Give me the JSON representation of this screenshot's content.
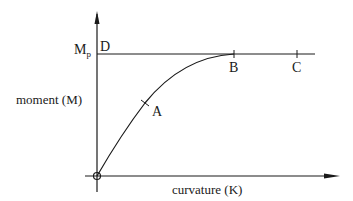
{
  "diagram": {
    "y_axis_label": "moment (M)",
    "x_axis_label": "curvature (K)",
    "plastic_moment_label": {
      "main": "M",
      "sub": "p"
    },
    "points": {
      "D": "D",
      "A": "A",
      "B": "B",
      "C": "C"
    },
    "colors": {
      "line": "#1a1a1a",
      "background": "#ffffff"
    }
  }
}
